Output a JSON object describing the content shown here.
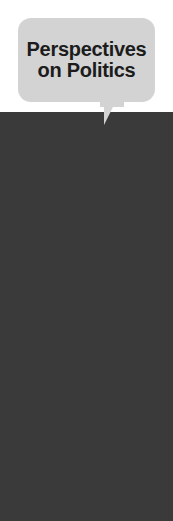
{
  "figure": {
    "title_line1": "Perspectives",
    "title_line2": "on Politics",
    "kicker_line1": "OPINIONS OF",
    "kicker_line2": "INSTITUTIONS, GROUPS,",
    "kicker_line3": "AND THE MEDIA",
    "lede_line1": "Percentage of eighteen- to",
    "lede_line2": "twenty-nine-year-olds",
    "lede_line3": "reporting,",
    "lede_quote_open": "“",
    "lede_line4": "I have a favorable overall",
    "lede_line5": "opinion of …",
    "lede_quote_close": "”",
    "source_label": "SOURCE:",
    "source_line1": " 1994 Times-Mirror",
    "source_line2": "poll, reported in Susan A.",
    "source_line3_pre": "MacManus, ",
    "source_line3_ital": "Young v. Old:",
    "source_line4_ital": "Generational Combat in the",
    "source_line5_ital": "21st Century",
    "source_line5_post": " (Boulder, CO:"
  },
  "colors": {
    "panel_dark": "#3a3a3a",
    "chart_bg": "#4a4a4a",
    "bubble_gray": "#d3d3d3",
    "bar_gray": "#c9c9c9",
    "kicker_gray": "#b9b9b9",
    "text_light": "#f2f2f2",
    "text_dark": "#1e1e1e"
  },
  "chart_data": {
    "type": "bar",
    "title": "Perspectives on Politics",
    "subtitle": "OPINIONS OF INSTITUTIONS, GROUPS, AND THE MEDIA",
    "description": "Percentage of eighteen- to twenty-nine-year-olds reporting, “I have a favorable overall opinion of …”",
    "xlabel": "",
    "ylabel": "",
    "xlim": [
      0,
      100
    ],
    "grid": false,
    "legend": null,
    "orientation": "horizontal",
    "unit": "%",
    "categories": [
      "The military",
      "The Supreme Court",
      "The women's movement",
      "The network news",
      "Labor unions",
      "The National Rifle Association",
      "MTV",
      "Congress",
      "Tobacco companies"
    ],
    "values": [
      84.6,
      81.1,
      80.2,
      67.7,
      67.6,
      60.2,
      59.0,
      53.4,
      27.3
    ],
    "value_labels": [
      "84.6%",
      "81.1%",
      "80.2%",
      "67.7%",
      "67.6%",
      "60.2%",
      "59.0%",
      "53.4%",
      "27.3%"
    ],
    "source": "1994 Times-Mirror poll, reported in Susan A. MacManus, Young v. Old: Generational Combat in the 21st Century (Boulder, CO:"
  },
  "bars": [
    {
      "label": "The military",
      "value_label": "84.6%",
      "width_px": 107,
      "label_outside": false
    },
    {
      "label": "The Supreme Court",
      "value_label": "81.1%",
      "width_px": 103,
      "label_outside": false
    },
    {
      "label": "The women's movement",
      "value_label": "80.2%",
      "width_px": 101,
      "label_outside": false
    },
    {
      "label": "The network news",
      "value_label": "67.7%",
      "width_px": 86,
      "label_outside": false
    },
    {
      "label": "Labor unions",
      "value_label": "67.6%",
      "width_px": 86,
      "label_outside": false
    },
    {
      "label": "The National Rifle Association",
      "value_label": "60.2%",
      "width_px": 101,
      "label_outside": false
    },
    {
      "label": "MTV",
      "value_label": "59.0%",
      "width_px": 75,
      "label_outside": false
    },
    {
      "label": "Congress",
      "value_label": "53.4%",
      "width_px": 68,
      "label_outside": false
    },
    {
      "label": "Tobacco companies",
      "value_label": "27.3%",
      "width_px": 87,
      "label_outside": true
    }
  ]
}
